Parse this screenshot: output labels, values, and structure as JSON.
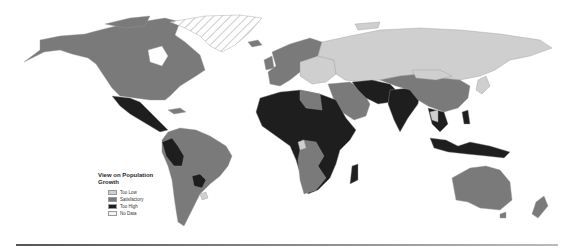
{
  "map": {
    "title": "View on Population Growth",
    "projection": "world",
    "categories": [
      {
        "key": "too_low",
        "label": "Too Low",
        "color": "#cfcfcf"
      },
      {
        "key": "satisfactory",
        "label": "Satisfactory",
        "color": "#7a7a7a"
      },
      {
        "key": "too_high",
        "label": "Too High",
        "color": "#1e1e1e"
      },
      {
        "key": "no_data",
        "label": "No Data",
        "color": "#ffffff",
        "pattern": "hatched"
      }
    ],
    "regions": [
      {
        "name": "North America (Canada, USA, Alaska)",
        "category": "satisfactory"
      },
      {
        "name": "Greenland",
        "category": "no_data"
      },
      {
        "name": "Mexico & Central America",
        "category": "too_high"
      },
      {
        "name": "South America (most)",
        "category": "satisfactory"
      },
      {
        "name": "Peru / Ecuador",
        "category": "too_high"
      },
      {
        "name": "Paraguay / Bolivia",
        "category": "too_high"
      },
      {
        "name": "Uruguay",
        "category": "too_low"
      },
      {
        "name": "Western Europe / Scandinavia",
        "category": "satisfactory"
      },
      {
        "name": "Eastern Europe",
        "category": "too_low"
      },
      {
        "name": "Russia & Central Asia",
        "category": "too_low"
      },
      {
        "name": "Middle East / Saudi Arabia",
        "category": "satisfactory"
      },
      {
        "name": "Iran / Pakistan / Afghanistan",
        "category": "too_high"
      },
      {
        "name": "India",
        "category": "too_high"
      },
      {
        "name": "China & Mongolia",
        "category": "satisfactory"
      },
      {
        "name": "Japan / Korea",
        "category": "too_low"
      },
      {
        "name": "Southeast Asia",
        "category": "too_high"
      },
      {
        "name": "North & Central Africa",
        "category": "too_high"
      },
      {
        "name": "Southern Africa (Angola, Namibia, S. Africa)",
        "category": "satisfactory"
      },
      {
        "name": "Madagascar",
        "category": "too_high"
      },
      {
        "name": "Indonesia / Papua",
        "category": "too_high"
      },
      {
        "name": "Australia",
        "category": "satisfactory"
      },
      {
        "name": "New Zealand",
        "category": "satisfactory"
      }
    ]
  }
}
